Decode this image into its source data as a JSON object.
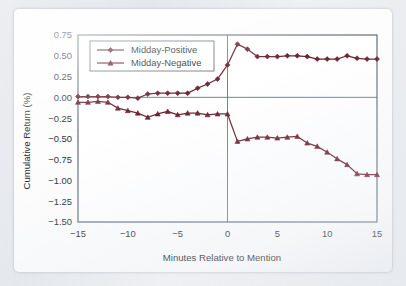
{
  "figure": {
    "background_color": "#fdfdfd",
    "page_background_color": "#e7eaee",
    "series_color": "#6b2230",
    "axis_color": "#55606d"
  },
  "chart_data": {
    "type": "line",
    "title": "",
    "subtitle": "",
    "xlabel": "Minutes Relative to Mention",
    "ylabel": "Cumulative Return (%)",
    "xlim": [
      -15,
      15
    ],
    "ylim": [
      -1.5,
      0.75
    ],
    "xticks": [
      -15,
      -10,
      -5,
      0,
      5,
      10,
      15
    ],
    "xtick_labels": [
      "−15",
      "−10",
      "−5",
      "0",
      "5",
      "10",
      "15"
    ],
    "yticks": [
      0.75,
      0.5,
      0.25,
      0.0,
      -0.25,
      -0.5,
      -0.75,
      -1.0,
      -1.25,
      -1.5
    ],
    "ytick_labels": [
      "0.75",
      "0.50",
      "0.25",
      "0.00",
      "−0.25",
      "−0.50",
      "−0.75",
      "−1.00",
      "−1.25",
      "−1.50"
    ],
    "grid": false,
    "reference_lines": [
      {
        "axis": "y",
        "value": 0.0
      },
      {
        "axis": "x",
        "value": 0.0
      }
    ],
    "legend_position": "upper-left",
    "x": [
      -15,
      -14,
      -13,
      -12,
      -11,
      -10,
      -9,
      -8,
      -7,
      -6,
      -5,
      -4,
      -3,
      -2,
      -1,
      0,
      1,
      2,
      3,
      4,
      5,
      6,
      7,
      8,
      9,
      10,
      11,
      12,
      13,
      14,
      15
    ],
    "series": [
      {
        "name": "Midday-Positive",
        "marker": "diamond",
        "values": [
          0.01,
          0.01,
          0.01,
          0.01,
          0.0,
          0.0,
          -0.01,
          0.04,
          0.05,
          0.05,
          0.05,
          0.05,
          0.11,
          0.16,
          0.22,
          0.39,
          0.64,
          0.58,
          0.49,
          0.49,
          0.49,
          0.5,
          0.5,
          0.49,
          0.46,
          0.46,
          0.46,
          0.5,
          0.47,
          0.46,
          0.46
        ]
      },
      {
        "name": "Midday-Negative",
        "marker": "triangle",
        "values": [
          -0.06,
          -0.06,
          -0.05,
          -0.06,
          -0.13,
          -0.16,
          -0.19,
          -0.24,
          -0.2,
          -0.17,
          -0.21,
          -0.19,
          -0.19,
          -0.21,
          -0.2,
          -0.2,
          -0.53,
          -0.5,
          -0.48,
          -0.48,
          -0.49,
          -0.48,
          -0.47,
          -0.55,
          -0.59,
          -0.66,
          -0.74,
          -0.81,
          -0.92,
          -0.93,
          -0.93
        ]
      }
    ]
  }
}
